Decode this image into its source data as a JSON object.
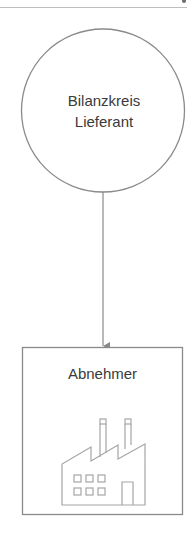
{
  "diagram": {
    "source_node": {
      "shape": "circle",
      "label_lines": [
        "Bilanzkreis",
        "Lieferant"
      ]
    },
    "target_node": {
      "shape": "rectangle",
      "label": "Abnehmer",
      "icon": "factory-icon"
    },
    "edge": {
      "from": "Bilanzkreis Lieferant",
      "to": "Abnehmer",
      "style": "arrow"
    },
    "colors": {
      "stroke": "#8a8a8a",
      "icon_stroke": "#a6a6a6",
      "text": "#3a3a3a",
      "rule": "#bdbdbd"
    }
  }
}
